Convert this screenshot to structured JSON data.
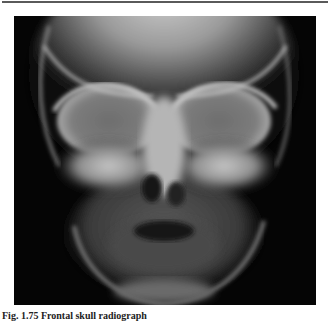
{
  "page": {
    "figure": {
      "type": "radiograph",
      "subject": "frontal skull x-ray",
      "alt": "Frontal radiograph of an infant skull showing orbits, nasal cavity, maxilla and mandible"
    },
    "caption": {
      "label": "Fig. 1.75",
      "text": "Frontal skull radiograph"
    }
  }
}
